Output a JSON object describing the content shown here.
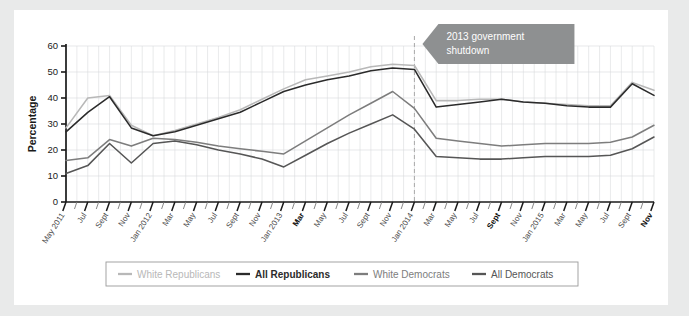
{
  "figure": {
    "background_color": "#e9eaea",
    "card_color": "#ffffff"
  },
  "annotation": {
    "line1": "2013 government",
    "line2": "shutdown",
    "fill_color": "#8e9091",
    "text_color": "#ffffff",
    "marker_label": "Jan 2014",
    "marker_style": "dashed-vertical"
  },
  "legend": {
    "position": "bottom",
    "items": [
      {
        "label": "White Republicans",
        "color": "#b8b8b8"
      },
      {
        "label": "All Republicans",
        "color": "#2b2b2b"
      },
      {
        "label": "White Democrats",
        "color": "#7d7d7d"
      },
      {
        "label": "All Democrats",
        "color": "#565656"
      }
    ]
  },
  "chart_data": {
    "type": "line",
    "title": "",
    "subtitle": "",
    "xlabel": "",
    "ylabel": "Percentage",
    "ylim": [
      0,
      60
    ],
    "yticks": [
      0,
      10,
      20,
      30,
      40,
      50,
      60
    ],
    "grid": true,
    "grid_color": "#d6d9db",
    "legend_position": "bottom",
    "annotations": [
      {
        "text": "2013 government shutdown",
        "x": "Jan 2014",
        "type": "callout"
      }
    ],
    "x_bold_ticks": [
      "Mar 2013",
      "Sept 2014",
      "Nov 2015"
    ],
    "categories": [
      "May 2011",
      "Jul",
      "Sept",
      "Nov",
      "Jan 2012",
      "Mar",
      "May",
      "Jul",
      "Sept",
      "Nov",
      "Jan 2013",
      "Mar",
      "May",
      "Jul",
      "Sept",
      "Nov",
      "Jan 2014",
      "Mar",
      "May",
      "Jul",
      "Sept",
      "Nov",
      "Jan 2015",
      "Mar",
      "May",
      "Jul",
      "Sept",
      "Nov"
    ],
    "series": [
      {
        "name": "White Republicans",
        "color": "#b8b8b8",
        "values": [
          28.5,
          40.0,
          41.0,
          29.5,
          25.5,
          27.5,
          30.0,
          32.5,
          35.5,
          39.5,
          43.5,
          47.0,
          48.5,
          50.0,
          52.0,
          53.0,
          52.5,
          39.0,
          39.0,
          39.5,
          39.5,
          38.5,
          38.0,
          37.5,
          37.0,
          37.0,
          46.0,
          43.0
        ]
      },
      {
        "name": "All Republicans",
        "color": "#2b2b2b",
        "values": [
          27.0,
          34.5,
          40.5,
          28.5,
          25.5,
          27.0,
          29.5,
          32.0,
          34.5,
          38.5,
          42.5,
          45.0,
          47.0,
          48.5,
          50.5,
          51.5,
          51.0,
          36.5,
          37.5,
          38.5,
          39.5,
          38.5,
          38.0,
          37.0,
          36.5,
          36.5,
          45.5,
          41.0
        ]
      },
      {
        "name": "White Democrats",
        "color": "#7d7d7d",
        "values": [
          16.0,
          17.0,
          24.0,
          21.5,
          24.5,
          24.0,
          23.0,
          21.5,
          20.5,
          19.5,
          18.5,
          23.5,
          28.5,
          33.5,
          38.0,
          42.5,
          36.0,
          24.5,
          23.5,
          22.5,
          21.5,
          22.0,
          22.5,
          22.5,
          22.5,
          23.0,
          25.0,
          29.5
        ]
      },
      {
        "name": "All Democrats",
        "color": "#565656",
        "values": [
          11.0,
          14.0,
          22.5,
          15.0,
          22.5,
          23.5,
          22.0,
          20.0,
          18.5,
          16.5,
          13.5,
          18.0,
          22.5,
          26.5,
          30.0,
          33.5,
          28.0,
          17.5,
          17.0,
          16.5,
          16.5,
          17.0,
          17.5,
          17.5,
          17.5,
          18.0,
          20.5,
          25.0
        ]
      }
    ]
  }
}
